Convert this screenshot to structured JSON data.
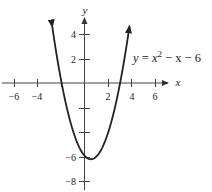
{
  "chart_data": {
    "type": "line",
    "title": "",
    "xlabel": "x",
    "ylabel": "y",
    "xlim": [
      -7,
      7
    ],
    "ylim": [
      -8.5,
      5.5
    ],
    "grid": false,
    "x_ticks": [
      -6,
      -4,
      -2,
      2,
      4,
      6
    ],
    "x_tick_labels": [
      "−6",
      "−4",
      "",
      "2",
      "4",
      "6"
    ],
    "y_ticks": [
      -8,
      -6,
      -4,
      -2,
      2,
      4
    ],
    "y_tick_labels": [
      "−8",
      "−6",
      "",
      "",
      "2",
      "4"
    ],
    "series": [
      {
        "name": "y = x^2 - x - 6",
        "equation": "y = x^2 - x - 6",
        "x_range": [
          -2.8,
          3.8
        ],
        "vertex": [
          0.5,
          -6.25
        ],
        "x_intercepts": [
          -2,
          3
        ],
        "y_intercept": -6,
        "arrows": "both ends"
      }
    ],
    "annotations": [
      {
        "text": "y = x² − x − 6",
        "position": "upper right"
      }
    ]
  },
  "labels": {
    "x_axis": "x",
    "y_axis": "y",
    "equation_lhs": "y",
    "equation_eq": " = ",
    "equation_x": "x",
    "equation_exp": "2",
    "equation_rest": " − x − 6",
    "tick_x_m6": "−6",
    "tick_x_m4": "−4",
    "tick_x_2": "2",
    "tick_x_4": "4",
    "tick_x_6": "6",
    "tick_y_4": "4",
    "tick_y_2": "2",
    "tick_y_m6": "−6",
    "tick_y_m8": "−8"
  },
  "colors": {
    "curve": "#222222",
    "axes": "#444444",
    "background": "#ffffff"
  }
}
